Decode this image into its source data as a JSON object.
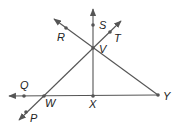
{
  "diagram": {
    "type": "geometry",
    "colors": {
      "line": "#555555",
      "label": "#222222",
      "background": "#ffffff"
    },
    "points": [
      {
        "name": "S",
        "label": "S",
        "x": 93,
        "y": 25,
        "label_x": 99,
        "label_y": 29
      },
      {
        "name": "R",
        "label": "R",
        "x": 66,
        "y": 28,
        "label_x": 57,
        "label_y": 41
      },
      {
        "name": "T",
        "label": "T",
        "x": 110,
        "y": 32,
        "label_x": 114,
        "label_y": 42
      },
      {
        "name": "V",
        "label": "V",
        "x": 93,
        "y": 48,
        "label_x": 99,
        "label_y": 53
      },
      {
        "name": "Q",
        "label": "Q",
        "x": 24,
        "y": 96,
        "label_x": 20,
        "label_y": 89
      },
      {
        "name": "W",
        "label": "W",
        "x": 44,
        "y": 96,
        "label_x": 45,
        "label_y": 107
      },
      {
        "name": "X",
        "label": "X",
        "x": 93,
        "y": 96,
        "label_x": 89,
        "label_y": 108
      },
      {
        "name": "Y",
        "label": "Y",
        "x": 158,
        "y": 95,
        "label_x": 163,
        "label_y": 100
      },
      {
        "name": "P",
        "label": "P",
        "x": 26,
        "y": 112,
        "label_x": 30,
        "label_y": 122
      }
    ],
    "lines": [
      {
        "name": "line-WY",
        "description": "ray from Y through W and Q (arrow at left)"
      },
      {
        "name": "line-PT",
        "description": "line through P, W, V, T (arrows both ends)"
      },
      {
        "name": "line-RY",
        "description": "ray from Y through V and R (arrow at R end)"
      },
      {
        "name": "line-XS",
        "description": "ray from X through V and S (arrow at top)"
      }
    ]
  }
}
